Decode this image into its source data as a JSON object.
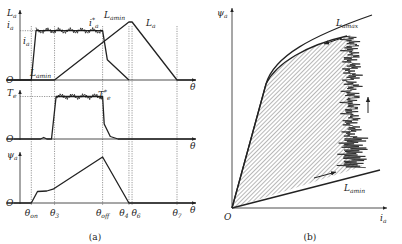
{
  "chart_data": [
    {
      "id": "a",
      "type": "line",
      "caption": "(a)",
      "xlabel": "θ",
      "angles": {
        "theta_on": {
          "label": "θ",
          "sub": "on"
        },
        "theta_3": {
          "label": "θ",
          "sub": "3"
        },
        "theta_off": {
          "label": "θ",
          "sub": "off"
        },
        "theta_4": {
          "label": "θ",
          "sub": "4"
        },
        "theta_6": {
          "label": "θ",
          "sub": "6"
        },
        "theta_7": {
          "label": "θ",
          "sub": "7"
        }
      },
      "x_positions_rel": {
        "theta_on": 0.06,
        "theta_3": 0.21,
        "theta_off": 0.52,
        "theta_4": 0.69,
        "theta_6": 0.71,
        "theta_7": 1.0
      },
      "subplots": [
        {
          "name": "inductance-current",
          "ylabel": {
            "text": "L",
            "sub": "a"
          },
          "origin_label": "O",
          "series": [
            {
              "name": "L_a",
              "label": {
                "text": "L",
                "sub": "a"
              },
              "points": [
                [
                  -0.1,
                  0
                ],
                [
                  0.21,
                  0
                ],
                [
                  0.69,
                  1
                ],
                [
                  0.71,
                  1
                ],
                [
                  1.0,
                  0
                ],
                [
                  1.12,
                  0
                ]
              ],
              "min_label": {
                "text": "L",
                "sub": "amin"
              },
              "max_label": {
                "text": "L",
                "sub": "amin"
              }
            },
            {
              "name": "i_a",
              "label": {
                "text": "i",
                "sub": "a"
              },
              "ref_label": {
                "text": "i",
                "sub": "a",
                "sup": "*"
              },
              "ref_level": 0.85,
              "points": [
                [
                  -0.1,
                  0
                ],
                [
                  0.06,
                  0
                ],
                [
                  0.09,
                  0.85
                ],
                [
                  0.52,
                  0.85
                ],
                [
                  0.55,
                  0.35
                ],
                [
                  0.69,
                  0
                ]
              ],
              "chopping": true
            }
          ]
        },
        {
          "name": "torque",
          "ylabel": {
            "text": "T",
            "sub": "e"
          },
          "origin_label": "O",
          "series": [
            {
              "name": "T_e",
              "ref_label": {
                "text": "T",
                "sub": "e",
                "sup": "*"
              },
              "ref_level": 0.85,
              "points": [
                [
                  -0.1,
                  0
                ],
                [
                  0.12,
                  0
                ],
                [
                  0.14,
                  0.03
                ],
                [
                  0.16,
                  0
                ],
                [
                  0.19,
                  0
                ],
                [
                  0.22,
                  0.85
                ],
                [
                  0.52,
                  0.85
                ],
                [
                  0.53,
                  0.3
                ],
                [
                  0.57,
                  0.05
                ],
                [
                  0.62,
                  0
                ],
                [
                  1.12,
                  0
                ]
              ],
              "chopping": true
            }
          ]
        },
        {
          "name": "flux-linkage",
          "ylabel": {
            "text": "ψ",
            "sub": "a"
          },
          "origin_label": "O",
          "series": [
            {
              "name": "psi_a",
              "points": [
                [
                  -0.1,
                  0
                ],
                [
                  0.06,
                  0
                ],
                [
                  0.1,
                  0.25
                ],
                [
                  0.16,
                  0.26
                ],
                [
                  0.2,
                  0.3
                ],
                [
                  0.52,
                  1.0
                ],
                [
                  0.69,
                  0
                ],
                [
                  1.12,
                  0
                ]
              ]
            }
          ]
        }
      ]
    },
    {
      "id": "b",
      "type": "area",
      "caption": "(b)",
      "xlabel": {
        "text": "i",
        "sub": "a"
      },
      "ylabel": {
        "text": "ψ",
        "sub": "a"
      },
      "origin_label": "O",
      "series": [
        {
          "name": "L_amax",
          "label": {
            "text": "L",
            "sub": "amax"
          },
          "description": "aligned magnetization curve (saturating)"
        },
        {
          "name": "L_amin",
          "label": {
            "text": "L",
            "sub": "amin"
          },
          "description": "unaligned magnetization line"
        },
        {
          "name": "energy-loop",
          "description": "hatched area enclosed by operating trajectory"
        }
      ],
      "arrows": [
        "along L_amax toward origin",
        "along L_amin away from origin",
        "upward at right edge of loop"
      ]
    }
  ]
}
